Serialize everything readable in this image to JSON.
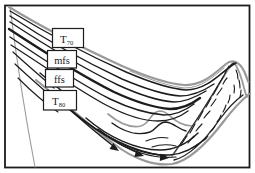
{
  "figure": {
    "labels": {
      "t70": {
        "main": "T",
        "sub": "70"
      },
      "mfs": "mfs",
      "ffs": "ffs",
      "t80": {
        "main": "T",
        "sub": "80"
      }
    },
    "colors": {
      "ink": "#1c1c1c",
      "gray": "#9a9a9a",
      "paper": "#ffffff"
    }
  }
}
